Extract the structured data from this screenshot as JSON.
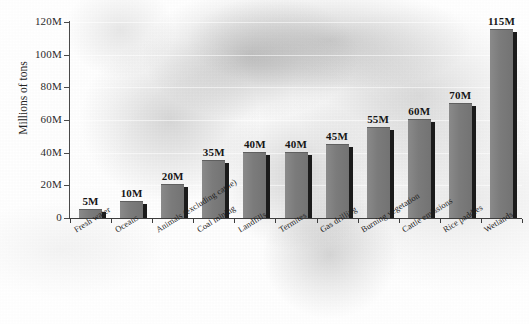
{
  "chart_data": {
    "type": "bar",
    "title": "",
    "xlabel": "",
    "ylabel": "Millions of tons",
    "ylim": [
      0,
      120
    ],
    "grid": true,
    "legend": "none",
    "orientation": "vertical",
    "value_suffix": "M",
    "categories": [
      "Fresh water",
      "Oceans",
      "Animals (excluding cattle)",
      "Coal mining",
      "Landfills",
      "Termites",
      "Gas drilling",
      "Burning vegetation",
      "Cattle emissions",
      "Rice paddies",
      "Wetlands"
    ],
    "values": [
      5,
      10,
      20,
      35,
      40,
      40,
      45,
      55,
      60,
      70,
      115
    ],
    "value_labels": [
      "5M",
      "10M",
      "20M",
      "35M",
      "40M",
      "40M",
      "45M",
      "55M",
      "60M",
      "70M",
      "115M"
    ],
    "ytick_values": [
      0,
      20,
      40,
      60,
      80,
      100,
      120
    ],
    "ytick_labels": [
      "0",
      "20M",
      "40M",
      "60M",
      "80M",
      "100M",
      "120M"
    ],
    "colors": {
      "bar_face": "#7b7b7b",
      "bar_shadow": "#1b1b1b",
      "axis": "#3d3d3d",
      "text": "#161616",
      "background": "#e9e9e9",
      "gridline": "#ffffff"
    }
  },
  "caption": {
    "text": ""
  }
}
